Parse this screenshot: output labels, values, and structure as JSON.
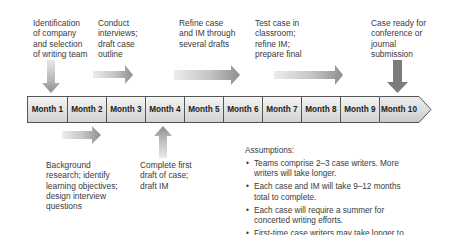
{
  "top_labels": [
    {
      "id": "identification",
      "text": "Identification\nof company\nand selection\nof writing team"
    },
    {
      "id": "conduct",
      "text": "Conduct\ninterviews;\ndraft case\noutline"
    },
    {
      "id": "refine",
      "text": "Refine case\nand IM through\nseveral drafts"
    },
    {
      "id": "test",
      "text": "Test case in\nclassroom;\nrefine IM;\nprepare final"
    },
    {
      "id": "ready",
      "text": "Case ready for\nconference or\njournal\nsubmission"
    }
  ],
  "bottom_labels": [
    {
      "id": "background",
      "text": "Background\nresearch; identify\nlearning objectives;\ndesign interview\nquestions"
    },
    {
      "id": "complete",
      "text": "Complete first\ndraft of case;\ndraft IM"
    }
  ],
  "timeline": {
    "months": [
      "Month 1",
      "Month 2",
      "Month 3",
      "Month 4",
      "Month 5",
      "Month 6",
      "Month 7",
      "Month 8",
      "Month 9",
      "Month 10"
    ]
  },
  "assumptions": {
    "title": "Assumptions:",
    "bullet": "•",
    "items": [
      "Teams comprise 2–3 case writers. More writers will take longer.",
      "Each case and IM will take 9–12 months total to complete.",
      "Each case will require a summer for concerted writing efforts.",
      "First-time case writers may take longer to complete the project."
    ]
  },
  "colors": {
    "arrow_light": "#e6e6e6",
    "arrow_dark": "#8c8c8c",
    "milestone_arrow": "#7a7a7a",
    "cell_border": "#555555"
  }
}
